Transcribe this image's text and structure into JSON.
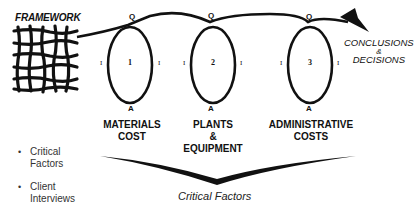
{
  "title": "FRAMEWORK",
  "loops": [
    {
      "number": "1",
      "top_label": "Q",
      "bottom_label": "A",
      "left_label": "I",
      "right_label": "I",
      "category": [
        "MATERIALS",
        "COST"
      ]
    },
    {
      "number": "2",
      "top_label": "Q",
      "bottom_label": "A",
      "left_label": "I",
      "right_label": "I",
      "category": [
        "PLANTS",
        "&",
        "EQUIPMENT"
      ]
    },
    {
      "number": "3",
      "top_label": "Q",
      "bottom_label": "A",
      "left_label": "I",
      "right_label": "I",
      "category": [
        "ADMINISTRATIVE",
        "COSTS"
      ]
    }
  ],
  "outcome": {
    "line1": "CONCLUSIONS",
    "line2": "&",
    "line3": "DECISIONS"
  },
  "bullets": [
    {
      "line1": "Critical",
      "line2": "Factors"
    },
    {
      "line1": "Client",
      "line2": "Interviews"
    }
  ],
  "footer": "Critical Factors",
  "icons": {
    "framework": "tangled-grid-icon",
    "arrow": "arrowhead-icon",
    "bullet": "•"
  }
}
